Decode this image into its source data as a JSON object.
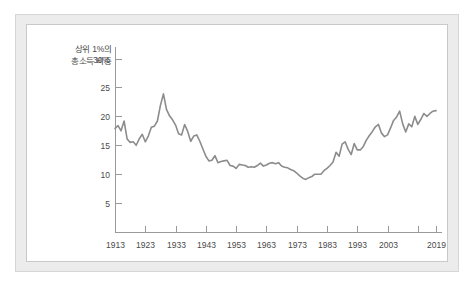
{
  "figure": {
    "background_color": "#ffffff",
    "frame_color": "#ececec",
    "panel_color": "#ffffff",
    "line_color": "#8c8c8c",
    "axis_color": "#9a9a9a",
    "text_color": "#4a4a4a"
  },
  "caption": {
    "line1": "상위 1%의",
    "line2": "총소득 비중"
  },
  "chart_data": {
    "type": "line",
    "title": "",
    "subtitle": "",
    "xlabel": "",
    "ylabel": "상위 1%의 총소득 비중",
    "ylabel_lines": [
      "상위 1%의",
      "총소득 비중"
    ],
    "xlim": [
      1913,
      2019
    ],
    "ylim": [
      0,
      32
    ],
    "grid": false,
    "legend": false,
    "legend_position": "none",
    "yticks": [
      5,
      10,
      15,
      20,
      25,
      30
    ],
    "ytick_labels": [
      "5",
      "10",
      "15",
      "20",
      "25",
      "30%"
    ],
    "xticks": [
      1913,
      1923,
      1933,
      1943,
      1953,
      1963,
      1973,
      1983,
      1993,
      2003,
      2013,
      2019
    ],
    "xtick_labels": [
      "1913",
      "1923",
      "1933",
      "1943",
      "1953",
      "1963",
      "1973",
      "1983",
      "1993",
      "2003",
      "",
      "2019"
    ],
    "series": [
      {
        "name": "상위 1% 총소득 비중",
        "color": "#8c8c8c",
        "x": [
          1913,
          1914,
          1915,
          1916,
          1917,
          1918,
          1919,
          1920,
          1921,
          1922,
          1923,
          1924,
          1925,
          1926,
          1927,
          1928,
          1929,
          1930,
          1931,
          1932,
          1933,
          1934,
          1935,
          1936,
          1937,
          1938,
          1939,
          1940,
          1941,
          1942,
          1943,
          1944,
          1945,
          1946,
          1947,
          1948,
          1949,
          1950,
          1951,
          1952,
          1953,
          1954,
          1955,
          1956,
          1957,
          1958,
          1959,
          1960,
          1961,
          1962,
          1963,
          1964,
          1965,
          1966,
          1967,
          1968,
          1969,
          1970,
          1971,
          1972,
          1973,
          1974,
          1975,
          1976,
          1977,
          1978,
          1979,
          1980,
          1981,
          1982,
          1983,
          1984,
          1985,
          1986,
          1987,
          1988,
          1989,
          1990,
          1991,
          1992,
          1993,
          1994,
          1995,
          1996,
          1997,
          1998,
          1999,
          2000,
          2001,
          2002,
          2003,
          2004,
          2005,
          2006,
          2007,
          2008,
          2009,
          2010,
          2011,
          2012,
          2013,
          2014,
          2015,
          2016,
          2017,
          2018,
          2019
        ],
        "y": [
          17.9,
          18.4,
          17.5,
          19.2,
          16.1,
          15.5,
          15.6,
          15.0,
          16.1,
          16.9,
          15.6,
          16.6,
          18.1,
          18.3,
          19.2,
          21.9,
          23.9,
          21.2,
          20.1,
          19.4,
          18.5,
          17.0,
          16.8,
          18.6,
          17.4,
          15.7,
          16.6,
          16.8,
          15.7,
          14.4,
          13.1,
          12.3,
          12.4,
          13.2,
          12.0,
          12.2,
          12.3,
          12.4,
          11.5,
          11.4,
          11.0,
          11.7,
          11.6,
          11.5,
          11.2,
          11.3,
          11.2,
          11.5,
          11.9,
          11.4,
          11.6,
          11.9,
          12.0,
          11.8,
          12.0,
          11.4,
          11.2,
          11.1,
          10.8,
          10.6,
          10.2,
          9.7,
          9.3,
          9.1,
          9.4,
          9.6,
          10.0,
          10.0,
          10.0,
          10.6,
          11.0,
          11.5,
          12.1,
          13.8,
          13.1,
          15.2,
          15.6,
          14.3,
          13.4,
          15.3,
          14.2,
          14.2,
          14.8,
          15.9,
          16.7,
          17.4,
          18.2,
          18.6,
          17.1,
          16.5,
          16.8,
          18.0,
          19.3,
          19.9,
          20.9,
          18.7,
          17.3,
          18.7,
          18.2,
          20.0,
          18.6,
          19.5,
          20.5,
          20.0,
          20.5,
          20.9,
          21.0
        ]
      }
    ]
  }
}
